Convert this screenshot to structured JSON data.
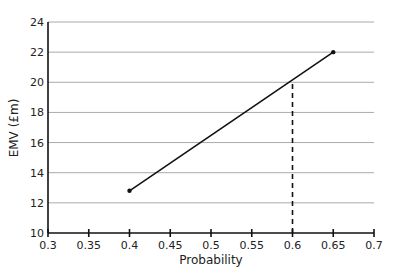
{
  "chart_data": {
    "type": "line",
    "title": "",
    "xlabel": "Probability",
    "ylabel": "EMV (£m)",
    "xlim": [
      0.3,
      0.7
    ],
    "ylim": [
      10,
      24
    ],
    "x_ticks": [
      "0.3",
      "0.35",
      "0.4",
      "0.45",
      "0.5",
      "0.55",
      "0.6",
      "0.65",
      "0.7"
    ],
    "y_ticks": [
      "10",
      "12",
      "14",
      "16",
      "18",
      "20",
      "22",
      "24"
    ],
    "grid": "horizontal",
    "series": [
      {
        "name": "EMV",
        "x": [
          0.4,
          0.65
        ],
        "y": [
          12.8,
          22
        ]
      }
    ],
    "annotations": [
      {
        "type": "dashed-vertical",
        "x": 0.6,
        "y_from": 10,
        "y_to": 20
      }
    ],
    "colors": {
      "line": "#111111",
      "grid": "#aaaaaa"
    }
  }
}
